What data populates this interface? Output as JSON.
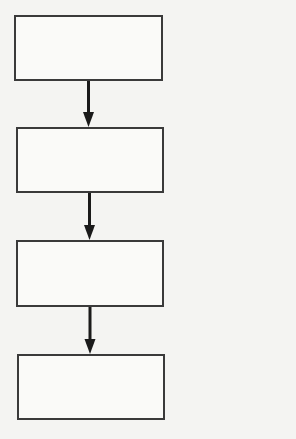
{
  "diagram": {
    "type": "flowchart",
    "orientation": "vertical",
    "colors": {
      "background": "#f4f4f2",
      "box_fill": "#fafaf8",
      "stroke": "#3a3a3a",
      "arrow": "#1a1a1a"
    },
    "nodes": [
      {
        "id": "step-1",
        "label": "",
        "x": 14,
        "y": 15,
        "w": 149,
        "h": 66
      },
      {
        "id": "step-2",
        "label": "",
        "x": 16,
        "y": 127,
        "w": 148,
        "h": 66
      },
      {
        "id": "step-3",
        "label": "",
        "x": 16,
        "y": 240,
        "w": 148,
        "h": 67
      },
      {
        "id": "step-4",
        "label": "",
        "x": 17,
        "y": 354,
        "w": 148,
        "h": 66
      }
    ],
    "edges": [
      {
        "from": "step-1",
        "to": "step-2"
      },
      {
        "from": "step-2",
        "to": "step-3"
      },
      {
        "from": "step-3",
        "to": "step-4"
      }
    ]
  }
}
